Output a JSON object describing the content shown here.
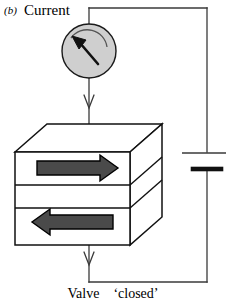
{
  "figure": {
    "panel_letter": "(b)",
    "current_label": "Current",
    "valve_word": "Valve",
    "valve_state": "‘closed’",
    "caption_full": "Valve ‘closed’"
  },
  "meter": {
    "name": "ammeter",
    "fill_color": "#cfcfcf",
    "stroke_color": "#1a1a1a",
    "needle_color": "#111111",
    "needle_direction": "up-left",
    "center_x": 89,
    "center_y": 51,
    "radius": 27
  },
  "device": {
    "name": "spin-valve-stack",
    "layer_count": 3,
    "layers": [
      {
        "id": "top-ferromagnet",
        "magnetization": "right",
        "arrow_label": "→"
      },
      {
        "id": "spacer",
        "magnetization": "none",
        "arrow_label": ""
      },
      {
        "id": "bottom-ferromagnet",
        "magnetization": "left",
        "arrow_label": "←"
      }
    ],
    "arrow_fill": "#4a4a4a",
    "arrow_stroke": "#000000",
    "face_fill": "#ffffff",
    "edge_color": "#111111"
  },
  "battery": {
    "name": "battery-cell",
    "long_plate_label": "positive",
    "short_plate_label": "negative",
    "color": "#111111"
  },
  "circuit": {
    "wire_color": "#3a3a3a",
    "current_arrows": [
      {
        "id": "current-arrow-upper",
        "direction": "down",
        "x": 89,
        "y": 100
      },
      {
        "id": "current-arrow-lower",
        "direction": "down",
        "x": 89,
        "y": 258
      }
    ]
  },
  "colors": {
    "background": "#ffffff",
    "ink": "#000000",
    "gray_fill": "#cfcfcf",
    "arrow_gray": "#4a4a4a"
  }
}
